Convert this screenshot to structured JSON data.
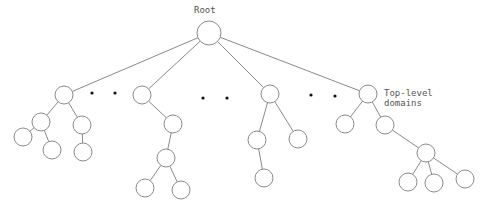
{
  "diagram": {
    "labels": {
      "root": "Root",
      "tld_line1": "Top-level",
      "tld_line2": "domains"
    },
    "colors": {
      "line": "#8a8a8a",
      "dot": "#111111",
      "text": "#555555",
      "background": "#ffffff"
    },
    "nodes": [
      {
        "id": "root",
        "x": 209,
        "y": 33,
        "r": 12
      },
      {
        "id": "t1",
        "x": 64,
        "y": 95,
        "r": 9
      },
      {
        "id": "t2",
        "x": 142,
        "y": 95,
        "r": 9
      },
      {
        "id": "t3",
        "x": 270,
        "y": 94,
        "r": 9
      },
      {
        "id": "t4",
        "x": 368,
        "y": 94,
        "r": 9
      },
      {
        "id": "a1",
        "x": 41,
        "y": 122,
        "r": 9
      },
      {
        "id": "a2",
        "x": 82,
        "y": 125,
        "r": 9
      },
      {
        "id": "a3",
        "x": 23,
        "y": 137,
        "r": 9
      },
      {
        "id": "a4",
        "x": 52,
        "y": 150,
        "r": 9
      },
      {
        "id": "a5",
        "x": 83,
        "y": 152,
        "r": 9
      },
      {
        "id": "b1",
        "x": 173,
        "y": 124,
        "r": 9
      },
      {
        "id": "b2",
        "x": 166,
        "y": 158,
        "r": 9
      },
      {
        "id": "b3",
        "x": 145,
        "y": 188,
        "r": 9
      },
      {
        "id": "b4",
        "x": 181,
        "y": 190,
        "r": 9
      },
      {
        "id": "c1",
        "x": 257,
        "y": 140,
        "r": 9
      },
      {
        "id": "c2",
        "x": 298,
        "y": 139,
        "r": 9
      },
      {
        "id": "c3",
        "x": 264,
        "y": 178,
        "r": 9
      },
      {
        "id": "d1",
        "x": 345,
        "y": 124,
        "r": 9
      },
      {
        "id": "d2",
        "x": 385,
        "y": 125,
        "r": 9
      },
      {
        "id": "d3",
        "x": 426,
        "y": 153,
        "r": 9
      },
      {
        "id": "d4",
        "x": 408,
        "y": 182,
        "r": 9
      },
      {
        "id": "d5",
        "x": 434,
        "y": 183,
        "r": 9
      },
      {
        "id": "d6",
        "x": 465,
        "y": 179,
        "r": 9
      }
    ],
    "edges": [
      [
        "root",
        "t1"
      ],
      [
        "root",
        "t2"
      ],
      [
        "root",
        "t3"
      ],
      [
        "root",
        "t4"
      ],
      [
        "t1",
        "a1"
      ],
      [
        "t1",
        "a2"
      ],
      [
        "a1",
        "a3"
      ],
      [
        "a1",
        "a4"
      ],
      [
        "a2",
        "a5"
      ],
      [
        "t2",
        "b1"
      ],
      [
        "b1",
        "b2"
      ],
      [
        "b2",
        "b3"
      ],
      [
        "b2",
        "b4"
      ],
      [
        "t3",
        "c1"
      ],
      [
        "t3",
        "c2"
      ],
      [
        "c1",
        "c3"
      ],
      [
        "t4",
        "d1"
      ],
      [
        "t4",
        "d2"
      ],
      [
        "d2",
        "d3"
      ],
      [
        "d3",
        "d4"
      ],
      [
        "d3",
        "d5"
      ],
      [
        "d3",
        "d6"
      ]
    ],
    "ellipsis_dots": [
      [
        92,
        93
      ],
      [
        115,
        93
      ],
      [
        203,
        98
      ],
      [
        227,
        98
      ],
      [
        311,
        95
      ],
      [
        335,
        96
      ]
    ]
  }
}
